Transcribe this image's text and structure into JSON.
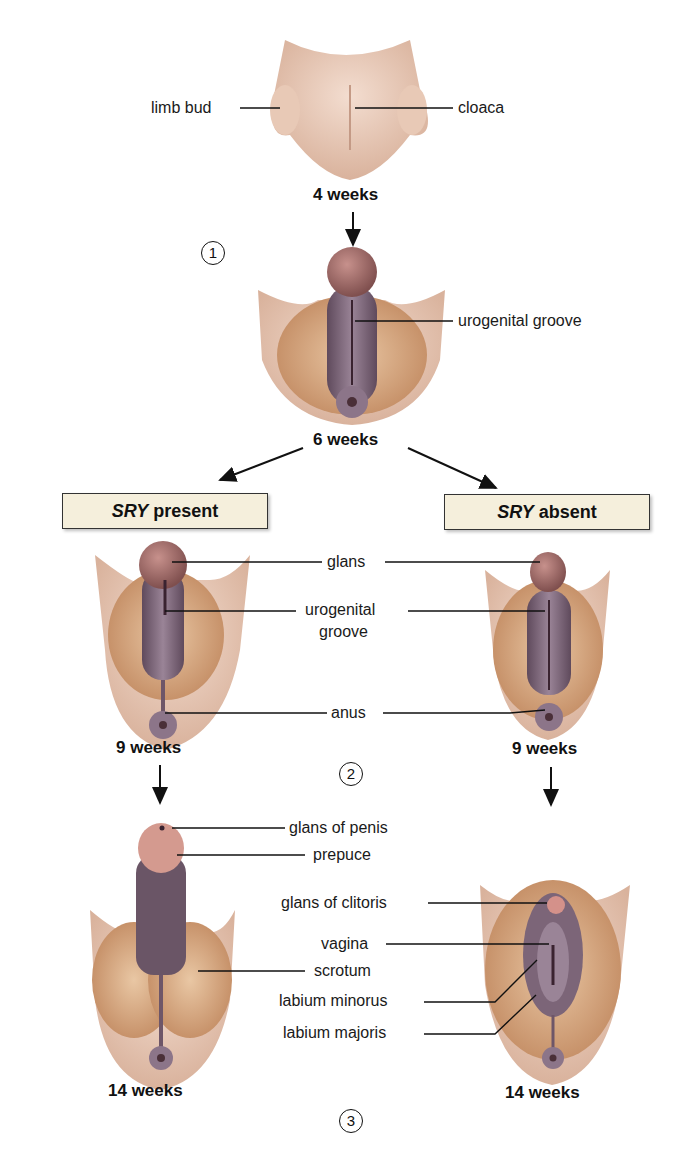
{
  "diagram": {
    "stages": {
      "week4": {
        "label": "4 weeks",
        "annotations": [
          "limb bud",
          "cloaca"
        ]
      },
      "week6": {
        "label": "6 weeks",
        "annotations": [
          "urogenital groove"
        ]
      },
      "week9": {
        "label_male": "9 weeks",
        "label_female": "9 weeks",
        "annotations": [
          "glans",
          "urogenital",
          "groove",
          "anus"
        ]
      },
      "week14": {
        "label_male": "14 weeks",
        "label_female": "14 weeks",
        "male_annotations": [
          "glans of penis",
          "prepuce",
          "scrotum"
        ],
        "female_annotations": [
          "glans of clitoris",
          "vagina",
          "labium minorus",
          "labium majoris"
        ]
      }
    },
    "branches": {
      "male": {
        "gene": "SRY",
        "state": "present"
      },
      "female": {
        "gene": "SRY",
        "state": "absent"
      }
    },
    "steps": [
      "1",
      "2",
      "3"
    ]
  },
  "colors": {
    "skin": "#e6c2a6",
    "skin_dark": "#c9956f",
    "tissue_purple": "#7e6678",
    "glans": "#9c6b68",
    "box_fill": "#f5efdc"
  }
}
